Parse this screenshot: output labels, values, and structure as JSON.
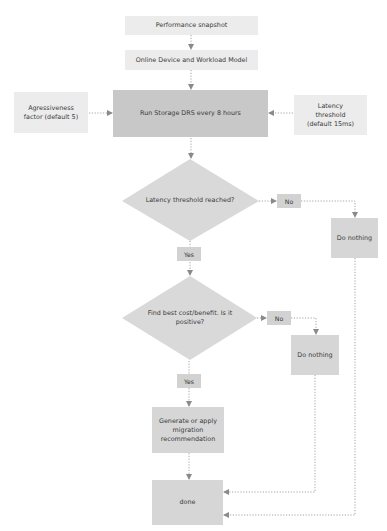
{
  "diagram": {
    "type": "flowchart",
    "colors": {
      "light_box": "#ececec",
      "main_box": "#c8c8c8",
      "decision": "#d9d9d9",
      "action_box": "#d6d6d6",
      "connector": "#9a9a9a"
    },
    "nodes": {
      "performance_snapshot": "Performance snapshot",
      "workload_model": "Online Device and Workload Model",
      "aggressiveness_factor": "Agressiveness factor (default 5)",
      "run_storage_drs": "Run Storage DRS every 8 hours",
      "latency_threshold": "Latency threshold (default 15ms)",
      "decision_latency": "Latency threshold reached?",
      "no_1": "No",
      "do_nothing_1": "Do nothing",
      "yes_1": "Yes",
      "decision_cost_benefit": "Find best cost/benefit. Is it positive?",
      "no_2": "No",
      "do_nothing_2": "Do nothing",
      "yes_2": "Yes",
      "generate_recommendation": "Generate or apply migration recommendation",
      "done": "done"
    },
    "edges": [
      {
        "from": "performance_snapshot",
        "to": "workload_model"
      },
      {
        "from": "workload_model",
        "to": "run_storage_drs"
      },
      {
        "from": "aggressiveness_factor",
        "to": "run_storage_drs"
      },
      {
        "from": "latency_threshold",
        "to": "run_storage_drs"
      },
      {
        "from": "run_storage_drs",
        "to": "decision_latency"
      },
      {
        "from": "decision_latency",
        "to": "do_nothing_1",
        "label": "No"
      },
      {
        "from": "decision_latency",
        "to": "decision_cost_benefit",
        "label": "Yes"
      },
      {
        "from": "decision_cost_benefit",
        "to": "do_nothing_2",
        "label": "No"
      },
      {
        "from": "decision_cost_benefit",
        "to": "generate_recommendation",
        "label": "Yes"
      },
      {
        "from": "generate_recommendation",
        "to": "done"
      },
      {
        "from": "do_nothing_2",
        "to": "done"
      },
      {
        "from": "do_nothing_1",
        "to": "done"
      }
    ]
  }
}
